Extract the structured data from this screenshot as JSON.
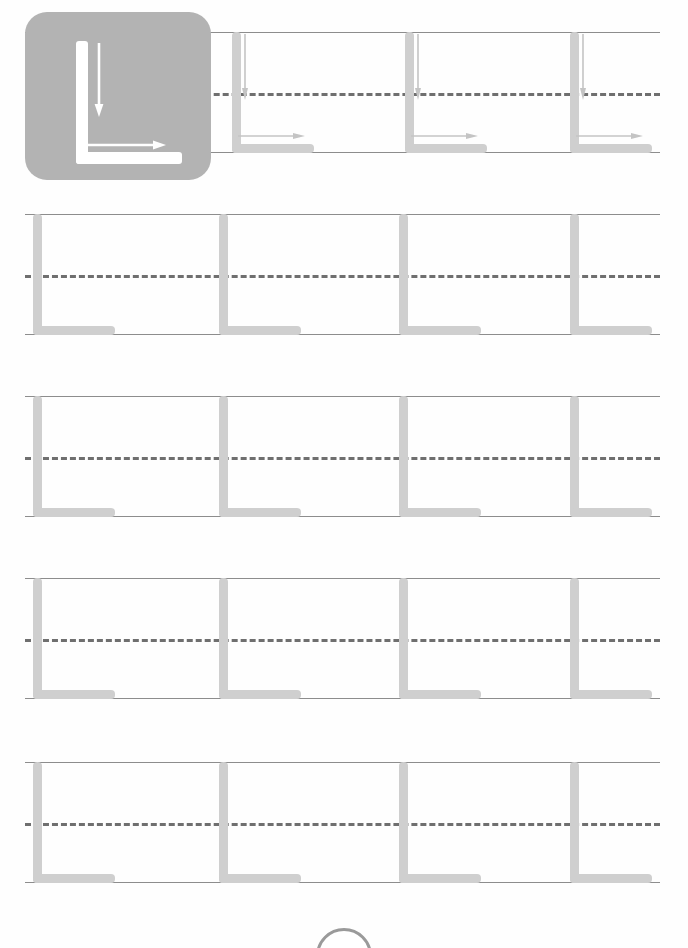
{
  "worksheet": {
    "letter": "L",
    "title": "Letter L Tracing Practice",
    "glyph_color": "#cfcfcf",
    "rule_color": "#8d8d8d",
    "dash_color": "#6f6f6f",
    "tile_color": "#b3b3b3",
    "tile_glyph_color": "#ffffff"
  },
  "example_tile": {
    "letter": "L",
    "name": "letter-l-example",
    "strokes": [
      {
        "order": 1,
        "name": "vertical-stroke-down",
        "direction": "down"
      },
      {
        "order": 2,
        "name": "horizontal-stroke-right",
        "direction": "right"
      }
    ]
  },
  "rows": [
    {
      "index": 1,
      "top": 32,
      "show_arrows": true,
      "glyphs": [
        {
          "x": 232
        },
        {
          "x": 405
        },
        {
          "x": 570
        }
      ]
    },
    {
      "index": 2,
      "top": 214,
      "show_arrows": false,
      "glyphs": [
        {
          "x": 33
        },
        {
          "x": 219
        },
        {
          "x": 399
        },
        {
          "x": 570
        }
      ]
    },
    {
      "index": 3,
      "top": 396,
      "show_arrows": false,
      "glyphs": [
        {
          "x": 33
        },
        {
          "x": 219
        },
        {
          "x": 399
        },
        {
          "x": 570
        }
      ]
    },
    {
      "index": 4,
      "top": 578,
      "show_arrows": false,
      "glyphs": [
        {
          "x": 33
        },
        {
          "x": 219
        },
        {
          "x": 399
        },
        {
          "x": 570
        }
      ]
    },
    {
      "index": 5,
      "top": 762,
      "show_arrows": false,
      "glyphs": [
        {
          "x": 33
        },
        {
          "x": 219
        },
        {
          "x": 399
        },
        {
          "x": 570
        }
      ]
    }
  ],
  "page_badge": {
    "name": "page-number-badge",
    "visible": true
  }
}
